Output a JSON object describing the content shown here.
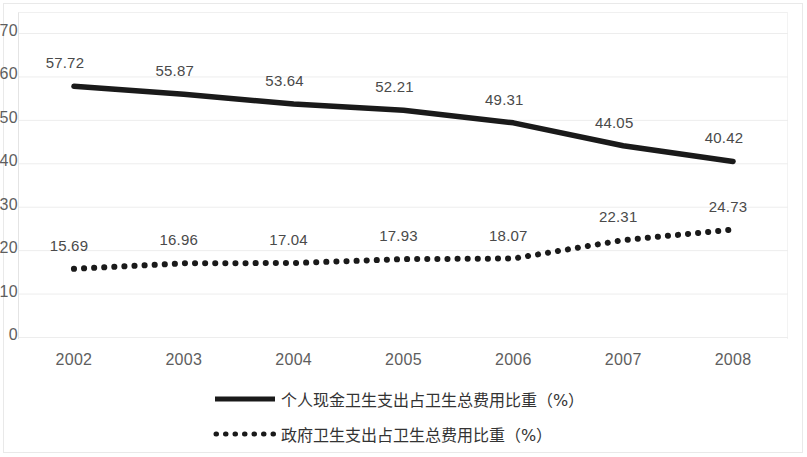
{
  "chart_data": {
    "type": "line",
    "title": "",
    "subtitle": "",
    "xlabel": "",
    "ylabel": "",
    "categories": [
      "2002",
      "2003",
      "2004",
      "2005",
      "2006",
      "2007",
      "2008"
    ],
    "series": [
      {
        "name": "个人现金卫生支出占卫生总费用比重（%）",
        "style": "solid",
        "color": "#1a1a1a",
        "values": [
          57.72,
          55.87,
          53.64,
          52.21,
          49.31,
          44.05,
          40.42
        ],
        "labels": [
          "57.72",
          "55.87",
          "53.64",
          "52.21",
          "49.31",
          "44.05",
          "40.42"
        ]
      },
      {
        "name": "政府卫生支出占卫生总费用比重（%）",
        "style": "dotted",
        "color": "#1a1a1a",
        "values": [
          15.69,
          16.96,
          17.04,
          17.93,
          18.07,
          22.31,
          24.73
        ],
        "labels": [
          "15.69",
          "16.96",
          "17.04",
          "17.93",
          "18.07",
          "22.31",
          "24.73"
        ]
      }
    ],
    "ylim": [
      0,
      70
    ],
    "ytick_labels": [
      "70",
      "60",
      "50",
      "40",
      "30",
      "20",
      "10",
      "0"
    ],
    "ytick_values": [
      70,
      60,
      50,
      40,
      30,
      20,
      10,
      0
    ],
    "grid": true,
    "grid_color": "#ededed",
    "legend_position": "bottom"
  },
  "axis": {
    "y_labels": [
      "70",
      "60",
      "50",
      "40",
      "30",
      "20",
      "10",
      "0"
    ],
    "x_labels": [
      "2002",
      "2003",
      "2004",
      "2005",
      "2006",
      "2007",
      "2008"
    ]
  },
  "legend": {
    "items": [
      {
        "label": "个人现金卫生支出占卫生总费用比重（%）",
        "marker": "solid-line-marker"
      },
      {
        "label": "政府卫生支出占卫生总费用比重（%）",
        "marker": "dotted-line-marker"
      }
    ]
  }
}
